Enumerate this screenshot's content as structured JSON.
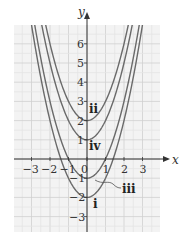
{
  "chart_data": {
    "type": "line",
    "title": "",
    "xlabel": "x",
    "ylabel": "y",
    "xlim": [
      -3.9,
      4.0
    ],
    "ylim": [
      -3.9,
      7.2
    ],
    "grid": true,
    "x_ticks": [
      -3,
      -2,
      -1,
      0,
      1,
      2,
      3
    ],
    "x_tick_labels": [
      "−3",
      "−2",
      "−1",
      "0",
      "1",
      "2",
      "3"
    ],
    "y_ticks": [
      -3,
      -2,
      -1,
      1,
      2,
      3,
      4,
      5,
      6
    ],
    "y_tick_labels": [
      "−3",
      "−2",
      "−1",
      "1",
      "2",
      "3",
      "4",
      "5",
      "6"
    ],
    "series": [
      {
        "name": "i",
        "equation": "y = x^2 - 2",
        "vertex": [
          0,
          -2
        ]
      },
      {
        "name": "ii",
        "equation": "y = x^2 + 2",
        "vertex": [
          0,
          2
        ]
      },
      {
        "name": "iii",
        "equation": "y = x^2 - 1",
        "vertex": [
          0,
          -1
        ]
      },
      {
        "name": "iv",
        "equation": "y = x^2 + 1",
        "vertex": [
          0,
          1
        ]
      }
    ],
    "labels": {
      "i": "i",
      "ii": "ii",
      "iii": "iii",
      "iv": "iv"
    },
    "colors": {
      "curve": "#6a6a6a",
      "grid": "#d8d8d8",
      "background": "#f3f3f3",
      "axis": "#333333"
    }
  },
  "axes": {
    "x_label": "x",
    "y_label": "y"
  }
}
